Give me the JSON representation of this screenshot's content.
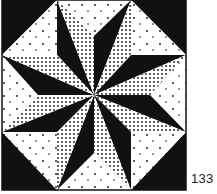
{
  "figure": {
    "number_label": "133",
    "colors": {
      "dark": "#111111",
      "light": "#ffffff",
      "stipple_dot": "#111111"
    },
    "block": {
      "x0": 2,
      "y0": 0,
      "x1": 186,
      "y1": 190,
      "center": [
        94,
        95
      ]
    },
    "star_tips": [
      [
        57,
        0
      ],
      [
        131,
        0
      ],
      [
        186,
        55
      ],
      [
        186,
        132
      ],
      [
        131,
        190
      ],
      [
        57,
        190
      ],
      [
        2,
        132
      ],
      [
        2,
        55
      ]
    ],
    "valleys": [
      [
        94,
        36
      ],
      [
        131,
        55
      ],
      [
        150,
        95
      ],
      [
        131,
        132
      ],
      [
        94,
        153
      ],
      [
        57,
        132
      ],
      [
        38,
        95
      ],
      [
        57,
        55
      ]
    ],
    "diamond_fill_rule": "half preceding tip (clockwise) is dark, following half is densely stippled",
    "corner_squares": "split diagonally: outer half dark, inner half white with sparse dots",
    "side_triangles": "white with sparse dots"
  }
}
